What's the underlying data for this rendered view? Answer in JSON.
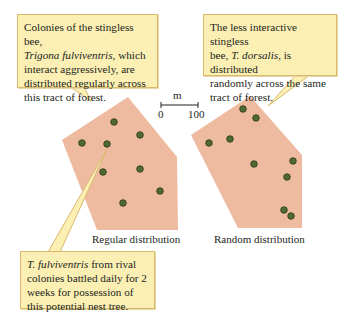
{
  "callouts": {
    "regular": {
      "line1": "Colonies of the stingless bee,",
      "species": "Trigona fulviventris,",
      "line2_rest": " which",
      "line3": "interact aggressively, are",
      "line4": "distributed regularly across",
      "line5": "this tract of forest."
    },
    "random": {
      "line1": "The less interactive stingless",
      "line2_pre": "bee, ",
      "species": "T. dorsalis",
      "line2_post": ", is distributed",
      "line3": "randomly across the same",
      "line4": "tract of forest."
    },
    "nest_tree": {
      "species": "T. fulviventris",
      "line1_post": " from rival",
      "line2": "colonies battled daily for 2",
      "line3": "weeks for possession of",
      "line4": "this potential nest tree."
    }
  },
  "scale_bar": {
    "unit": "m",
    "min_label": "0",
    "max_label": "100"
  },
  "panels": {
    "regular": {
      "label": "Regular distribution",
      "polygon": [
        [
          128,
          97
        ],
        [
          177,
          157
        ],
        [
          178,
          230
        ],
        [
          97,
          230
        ],
        [
          62,
          140
        ]
      ],
      "dots": [
        [
          114,
          122
        ],
        [
          140,
          135
        ],
        [
          82,
          143
        ],
        [
          107,
          144
        ],
        [
          103,
          172
        ],
        [
          140,
          169
        ],
        [
          160,
          191
        ],
        [
          123,
          203
        ]
      ]
    },
    "random": {
      "label": "Random distribution",
      "polygon": [
        [
          250,
          96
        ],
        [
          302,
          155
        ],
        [
          302,
          228
        ],
        [
          238,
          228
        ],
        [
          191,
          135
        ]
      ],
      "dots": [
        [
          243,
          109
        ],
        [
          256,
          118
        ],
        [
          209,
          143
        ],
        [
          230,
          139
        ],
        [
          254,
          164
        ],
        [
          293,
          161
        ],
        [
          287,
          177
        ],
        [
          284,
          210
        ],
        [
          291,
          216
        ]
      ]
    }
  },
  "colors": {
    "forest_fill": "#efbba0",
    "colony_dot": "#4e6a2e",
    "colony_ring": "#2f3a1e",
    "callout_fill": "#fbefb4",
    "callout_border": "#d9b96c"
  }
}
